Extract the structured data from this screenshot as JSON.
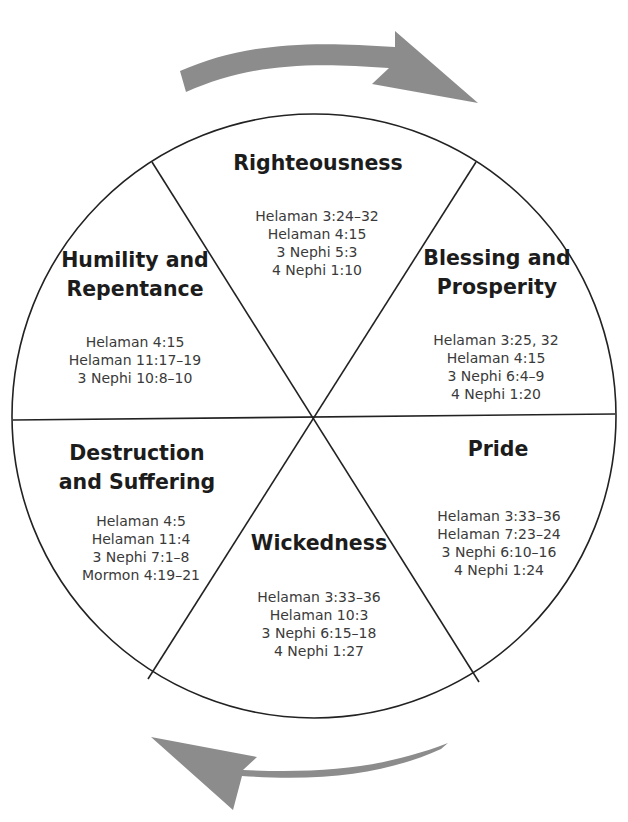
{
  "diagram": {
    "type": "cycle-wheel",
    "colors": {
      "arrow": "#8c8c8c",
      "line": "#222222",
      "title": "#1c1c1c",
      "ref": "#3a3a3a"
    },
    "arrows": [
      {
        "position": "top",
        "direction": "clockwise"
      },
      {
        "position": "bottom",
        "direction": "clockwise"
      }
    ],
    "segments": [
      {
        "title": [
          "Righteousness"
        ],
        "refs": [
          "Helaman 3:24–32",
          "Helaman 4:15",
          "3 Nephi 5:3",
          "4 Nephi 1:10"
        ]
      },
      {
        "title": [
          "Blessing and",
          "Prosperity"
        ],
        "refs": [
          "Helaman 3:25, 32",
          "Helaman 4:15",
          "3 Nephi 6:4–9",
          "4 Nephi 1:20"
        ]
      },
      {
        "title": [
          "Pride"
        ],
        "refs": [
          "Helaman 3:33–36",
          "Helaman 7:23–24",
          "3 Nephi 6:10–16",
          "4 Nephi 1:24"
        ]
      },
      {
        "title": [
          "Wickedness"
        ],
        "refs": [
          "Helaman 3:33–36",
          "Helaman 10:3",
          "3 Nephi 6:15–18",
          "4 Nephi 1:27"
        ]
      },
      {
        "title": [
          "Destruction",
          "and Suffering"
        ],
        "refs": [
          "Helaman 4:5",
          "Helaman 11:4",
          "3 Nephi 7:1–8",
          "Mormon 4:19–21"
        ]
      },
      {
        "title": [
          "Humility and",
          "Repentance"
        ],
        "refs": [
          "Helaman 4:15",
          "Helaman 11:17–19",
          "3 Nephi 10:8–10"
        ]
      }
    ]
  }
}
